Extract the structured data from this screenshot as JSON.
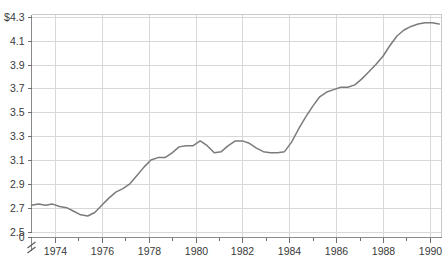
{
  "chart_data": {
    "type": "line",
    "title": "",
    "subtitle": "",
    "xlabel": "",
    "ylabel": "",
    "grid": true,
    "legend": null,
    "axis_break": {
      "present": true,
      "between": [
        0,
        2.5
      ],
      "symbol": "double-slash"
    },
    "xlim": [
      1973.0,
      1990.5
    ],
    "ylim": [
      2.45,
      4.32
    ],
    "y_value_prefix": "$",
    "x_tick_labels": [
      "1974",
      "1976",
      "1978",
      "1980",
      "1982",
      "1984",
      "1986",
      "1988",
      "1990"
    ],
    "x_ticks": [
      1974,
      1976,
      1978,
      1980,
      1982,
      1984,
      1986,
      1988,
      1990
    ],
    "x_minor_ticks": [
      1975,
      1977,
      1979,
      1981,
      1983,
      1985,
      1987,
      1989
    ],
    "y_tick_labels": [
      "$4.3",
      "4.1",
      "3.9",
      "3.7",
      "3.5",
      "3.3",
      "3.1",
      "2.9",
      "2.7",
      "2.5",
      "0"
    ],
    "y_ticks": [
      4.3,
      4.1,
      3.9,
      3.7,
      3.5,
      3.3,
      3.1,
      2.9,
      2.7,
      2.5,
      0
    ],
    "series": [
      {
        "name": "value",
        "color": "#7b7b7b",
        "x": [
          1973.0,
          1973.3,
          1973.6,
          1973.9,
          1974.2,
          1974.5,
          1974.8,
          1975.1,
          1975.4,
          1975.7,
          1976.0,
          1976.3,
          1976.6,
          1976.9,
          1977.2,
          1977.5,
          1977.8,
          1978.1,
          1978.4,
          1978.7,
          1979.0,
          1979.3,
          1979.6,
          1979.9,
          1980.2,
          1980.5,
          1980.8,
          1981.1,
          1981.4,
          1981.7,
          1982.0,
          1982.3,
          1982.6,
          1982.9,
          1983.2,
          1983.5,
          1983.8,
          1984.1,
          1984.4,
          1984.7,
          1985.0,
          1985.3,
          1985.6,
          1985.9,
          1986.2,
          1986.5,
          1986.8,
          1987.1,
          1987.4,
          1987.7,
          1988.0,
          1988.3,
          1988.6,
          1988.9,
          1989.2,
          1989.5,
          1989.8,
          1990.1,
          1990.4
        ],
        "y": [
          2.72,
          2.73,
          2.72,
          2.73,
          2.71,
          2.7,
          2.67,
          2.64,
          2.63,
          2.66,
          2.72,
          2.78,
          2.83,
          2.86,
          2.9,
          2.97,
          3.04,
          3.1,
          3.12,
          3.12,
          3.16,
          3.21,
          3.22,
          3.22,
          3.26,
          3.22,
          3.16,
          3.17,
          3.22,
          3.26,
          3.26,
          3.24,
          3.2,
          3.17,
          3.16,
          3.16,
          3.17,
          3.25,
          3.36,
          3.46,
          3.55,
          3.63,
          3.67,
          3.69,
          3.71,
          3.71,
          3.73,
          3.78,
          3.84,
          3.9,
          3.97,
          4.06,
          4.14,
          4.19,
          4.22,
          4.24,
          4.25,
          4.25,
          4.24
        ]
      }
    ],
    "annotations": []
  },
  "axis": {
    "y_break_label_top": "2.5",
    "y_break_label_bottom": "0"
  }
}
